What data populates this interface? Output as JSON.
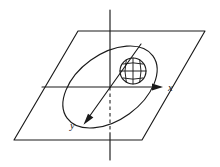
{
  "figure": {
    "background_color": "#ffffff",
    "line_color": "#1a1a1a",
    "labels": {
      "x_axis": "x",
      "y_axis": "y"
    },
    "elements": {
      "plane": "parallelogram-plane",
      "vertical_axis": "z-axis-line",
      "horizontal_axis": "x-axis-arrow",
      "depth_axis": "y-axis-arrow",
      "orbit": "tilted-ellipse-orbit",
      "body": "gridded-sphere"
    },
    "geometry": {
      "plane_corners": [
        [
          78,
          31
        ],
        [
          205,
          31
        ],
        [
          142,
          140
        ],
        [
          14,
          140
        ]
      ],
      "origin": [
        110,
        87
      ],
      "x_axis": {
        "from": [
          42,
          87
        ],
        "to": [
          163,
          87
        ]
      },
      "y_axis": {
        "from": [
          141,
          44
        ],
        "to": [
          84,
          124
        ]
      },
      "z_axis": {
        "from": [
          110,
          10
        ],
        "to": [
          110,
          160
        ],
        "dashed_from": [
          110,
          87
        ],
        "dashed_to": [
          110,
          133
        ]
      },
      "ellipse": {
        "center": [
          110,
          87
        ],
        "rx": 53,
        "ry": 33,
        "rotation_deg": -36
      },
      "sphere": {
        "center": [
          133,
          71
        ],
        "r": 13
      }
    }
  }
}
